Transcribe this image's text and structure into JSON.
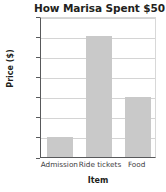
{
  "chart_data": {
    "type": "bar",
    "title": "How Marisa Spent $50",
    "xlabel": "Item",
    "ylabel": "Price ($)",
    "categories": [
      "Admission",
      "Ride tickets",
      "Food"
    ],
    "values": [
      5,
      30,
      15
    ],
    "ylim": [
      0,
      35
    ],
    "ytick_labels": [
      "0",
      "5",
      "10",
      "15",
      "20",
      "25",
      "30",
      "35"
    ],
    "ytick_values": [
      0,
      5,
      10,
      15,
      20,
      25,
      30,
      35
    ],
    "grid": true,
    "legend": false,
    "bar_color": "#c9c9c9",
    "axis_color": "#58595b",
    "grid_color": "#d4d4d4",
    "text_color": "#231f20"
  }
}
